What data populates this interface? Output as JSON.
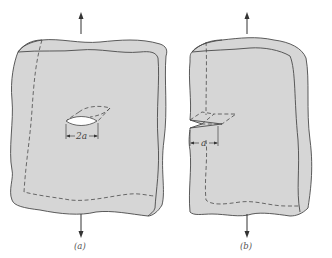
{
  "figure": {
    "panels": [
      {
        "id": "a",
        "caption": "(a)",
        "description": "Plate with interior (center) crack under tension",
        "crack_dimension_label": "2a",
        "load_arrows": [
          "up",
          "down"
        ]
      },
      {
        "id": "b",
        "caption": "(b)",
        "description": "Plate with edge crack under tension",
        "crack_dimension_label": "a",
        "load_arrows": [
          "up",
          "down"
        ]
      }
    ],
    "colors": {
      "plate_fill": "#d6d6d6",
      "outline": "#4a4a4a",
      "crack_opening": "#ffffff",
      "background": "#ffffff"
    }
  }
}
